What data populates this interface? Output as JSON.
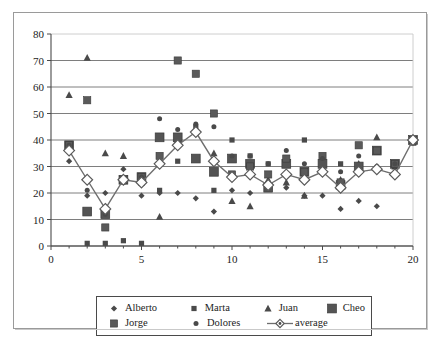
{
  "chart_data": {
    "type": "scatter",
    "title": "",
    "xlabel": "",
    "ylabel": "",
    "xlim": [
      0,
      20
    ],
    "ylim": [
      0,
      80
    ],
    "xticks": [
      0,
      5,
      10,
      15,
      20
    ],
    "yticks": [
      0,
      10,
      20,
      30,
      40,
      50,
      60,
      70,
      80
    ],
    "grid": "horizontal",
    "legend_position": "bottom",
    "x": [
      1,
      2,
      3,
      4,
      5,
      6,
      7,
      8,
      9,
      10,
      11,
      12,
      13,
      14,
      15,
      16,
      17,
      18,
      19,
      20
    ],
    "series": [
      {
        "name": "Alberto",
        "marker": "small-diamond",
        "color": "#4a4a4a",
        "values": [
          32,
          19,
          20,
          29,
          19,
          20,
          20,
          18,
          13,
          21,
          20,
          24,
          22,
          19,
          19,
          14,
          17,
          15,
          28,
          39
        ]
      },
      {
        "name": "Marta",
        "marker": "small-square",
        "color": "#4a4a4a",
        "values": [
          38,
          1,
          1,
          2,
          1,
          21,
          32,
          45,
          21,
          40,
          34,
          31,
          31,
          40,
          32,
          31,
          30,
          36,
          31,
          40
        ]
      },
      {
        "name": "Juan",
        "marker": "triangle",
        "color": "#4a4a4a",
        "values": [
          57,
          71,
          35,
          34,
          24,
          11,
          40,
          43,
          35,
          17,
          15,
          25,
          24,
          19,
          28,
          25,
          31,
          41,
          30,
          39
        ]
      },
      {
        "name": "Cheo",
        "marker": "large-square",
        "color": "#545454",
        "values": [
          38,
          13,
          12,
          25,
          26,
          41,
          41,
          33,
          28,
          33,
          31,
          22,
          31,
          28,
          31,
          23,
          30,
          36,
          31,
          40
        ]
      },
      {
        "name": "Jorge",
        "marker": "medium-square",
        "color": "#5a5a5a",
        "values": [
          38,
          55,
          7,
          25,
          26,
          34,
          70,
          65,
          50,
          27,
          30,
          27,
          33,
          28,
          34,
          24,
          38,
          36,
          31,
          40
        ]
      },
      {
        "name": "Dolores",
        "marker": "small-circle",
        "color": "#4a4a4a",
        "values": [
          38,
          21,
          12,
          24,
          26,
          48,
          44,
          46,
          45,
          34,
          34,
          31,
          36,
          31,
          33,
          28,
          34,
          30,
          31,
          40
        ]
      }
    ],
    "average_series": {
      "name": "average",
      "marker": "open-diamond-line",
      "color": "#6e6e6e",
      "values": [
        36,
        25,
        14,
        25,
        24,
        31,
        38,
        43,
        32,
        26,
        27,
        23,
        27,
        25,
        28,
        22,
        28,
        29,
        27,
        40
      ]
    }
  },
  "legend": {
    "rows": [
      [
        {
          "label": "Alberto",
          "marker": "small-diamond"
        },
        {
          "label": "Marta",
          "marker": "small-square"
        },
        {
          "label": "Juan",
          "marker": "triangle"
        },
        {
          "label": "Cheo",
          "marker": "large-square"
        }
      ],
      [
        {
          "label": "Jorge",
          "marker": "medium-square"
        },
        {
          "label": "Dolores",
          "marker": "small-circle"
        },
        {
          "label": "average",
          "marker": "open-diamond-line"
        }
      ]
    ]
  },
  "style": {
    "axis_color": "#4a4a4a",
    "grid_color": "#6f6f6f",
    "text_color": "#1c1c1c",
    "frame_color": "#9a9a9a",
    "plot_background": "#ffffff"
  }
}
